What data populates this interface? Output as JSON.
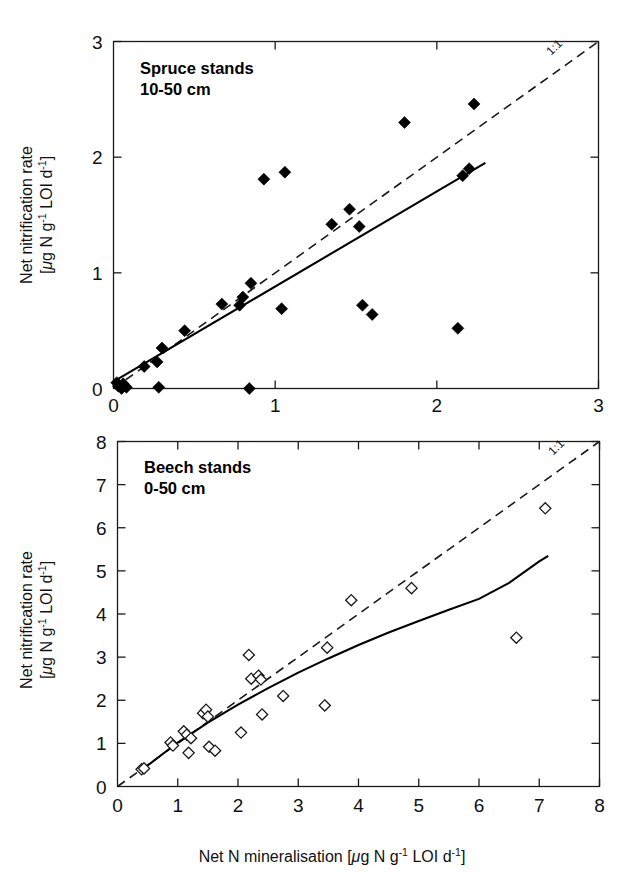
{
  "figure": {
    "background": "#ffffff",
    "ink_color": "#000000",
    "xlabel_parts": {
      "lead": "Net N mineralisation [",
      "mu": "μ",
      "mid1": "g N g",
      "sup1": "-1",
      "mid2": " LOI d",
      "sup2": "-1",
      "tail": "]"
    },
    "ylabel_parts": {
      "line1": "Net nitrification rate",
      "lead": "[",
      "mu": "μ",
      "mid1": "g N g",
      "sup1": "-1",
      "mid2": " LOI d",
      "sup2": "-1",
      "tail": "]"
    }
  },
  "chart_data": [
    {
      "id": "spruce",
      "type": "scatter",
      "title": "Spruce stands",
      "subtitle": "10-50 cm",
      "xlabel": "Net N mineralisation [μg N g-1 LOI d-1]",
      "ylabel": "Net nitrification rate [μg N g-1 LOI d-1]",
      "xlim": [
        0,
        3
      ],
      "ylim": [
        0,
        3
      ],
      "xticks": [
        0,
        1,
        2,
        3
      ],
      "yticks": [
        0,
        1,
        2,
        3
      ],
      "xticklabels": [
        "0",
        "1",
        "2",
        "3"
      ],
      "yticklabels": [
        "0",
        "1",
        "2",
        "3"
      ],
      "grid": false,
      "marker": "filled-diamond",
      "marker_color": "#000000",
      "points": [
        [
          0.02,
          0.05
        ],
        [
          0.03,
          0.02
        ],
        [
          0.05,
          0.0
        ],
        [
          0.06,
          0.04
        ],
        [
          0.08,
          0.01
        ],
        [
          0.19,
          0.19
        ],
        [
          0.27,
          0.23
        ],
        [
          0.28,
          0.01
        ],
        [
          0.3,
          0.35
        ],
        [
          0.44,
          0.5
        ],
        [
          0.67,
          0.73
        ],
        [
          0.78,
          0.72
        ],
        [
          0.8,
          0.79
        ],
        [
          0.84,
          0.0
        ],
        [
          0.85,
          0.91
        ],
        [
          0.93,
          1.81
        ],
        [
          1.04,
          0.69
        ],
        [
          1.06,
          1.87
        ],
        [
          1.35,
          1.42
        ],
        [
          1.46,
          1.55
        ],
        [
          1.52,
          1.4
        ],
        [
          1.54,
          0.72
        ],
        [
          1.6,
          0.64
        ],
        [
          1.8,
          2.3
        ],
        [
          2.13,
          0.52
        ],
        [
          2.16,
          1.84
        ],
        [
          2.2,
          1.9
        ],
        [
          2.23,
          2.46
        ]
      ],
      "fit_line": {
        "style": "solid",
        "label": "regression",
        "x": [
          0.0,
          2.3
        ],
        "y": [
          0.06,
          1.95
        ]
      },
      "reference_line": {
        "style": "dashed",
        "label": "1:1",
        "x": [
          0.0,
          3.0
        ],
        "y": [
          0.0,
          3.0
        ]
      }
    },
    {
      "id": "beech",
      "type": "scatter",
      "title": "Beech stands",
      "subtitle": "0-50 cm",
      "xlabel": "Net N mineralisation [μg N g-1 LOI d-1]",
      "ylabel": "Net nitrification rate [μg N g-1 LOI d-1]",
      "xlim": [
        0,
        8
      ],
      "ylim": [
        0,
        8
      ],
      "xticks": [
        0,
        1,
        2,
        3,
        4,
        5,
        6,
        7,
        8
      ],
      "yticks": [
        0,
        1,
        2,
        3,
        4,
        5,
        6,
        7,
        8
      ],
      "xticklabels": [
        "0",
        "1",
        "2",
        "3",
        "4",
        "5",
        "6",
        "7",
        "8"
      ],
      "yticklabels": [
        "0",
        "1",
        "2",
        "3",
        "4",
        "5",
        "6",
        "7",
        "8"
      ],
      "grid": false,
      "marker": "open-diamond",
      "marker_color": "#ffffff",
      "marker_edge": "#1a1a1a",
      "points": [
        [
          0.4,
          0.4
        ],
        [
          0.44,
          0.42
        ],
        [
          0.88,
          1.02
        ],
        [
          0.92,
          0.95
        ],
        [
          1.1,
          1.28
        ],
        [
          1.15,
          1.2
        ],
        [
          1.18,
          0.78
        ],
        [
          1.22,
          1.12
        ],
        [
          1.42,
          1.7
        ],
        [
          1.47,
          1.78
        ],
        [
          1.5,
          1.62
        ],
        [
          1.52,
          0.92
        ],
        [
          1.62,
          0.83
        ],
        [
          2.05,
          1.25
        ],
        [
          2.18,
          3.05
        ],
        [
          2.22,
          2.5
        ],
        [
          2.34,
          2.57
        ],
        [
          2.38,
          2.48
        ],
        [
          2.4,
          1.67
        ],
        [
          2.75,
          2.1
        ],
        [
          3.44,
          1.88
        ],
        [
          3.48,
          3.22
        ],
        [
          3.88,
          4.32
        ],
        [
          4.88,
          4.6
        ],
        [
          6.62,
          3.45
        ],
        [
          7.1,
          6.45
        ]
      ],
      "fit_line": {
        "style": "solid-curved",
        "label": "regression",
        "x": [
          0.38,
          1.0,
          1.5,
          2.0,
          2.5,
          3.0,
          3.5,
          4.0,
          4.5,
          5.0,
          5.5,
          6.0,
          6.5,
          7.0,
          7.15
        ],
        "y": [
          0.36,
          1.02,
          1.48,
          1.9,
          2.28,
          2.64,
          2.97,
          3.28,
          3.57,
          3.84,
          4.1,
          4.35,
          4.72,
          5.22,
          5.35
        ]
      },
      "reference_line": {
        "style": "dashed",
        "label": "1:1",
        "x": [
          0.0,
          8.0
        ],
        "y": [
          0.0,
          8.0
        ]
      }
    }
  ]
}
